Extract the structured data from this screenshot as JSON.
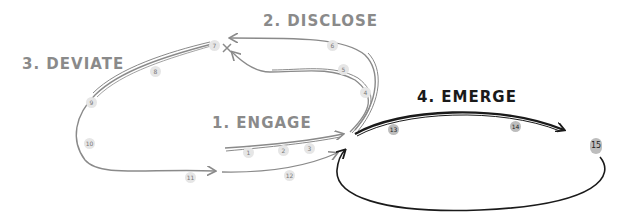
{
  "diagram": {
    "type": "hand-drawn process flow",
    "colors": {
      "gray_stroke": "#8a8a8a",
      "dark_stroke": "#1a1a1a",
      "step_fill": "#e6e6e6"
    },
    "phases": [
      {
        "id": "engage",
        "label": "1. ENGAGE"
      },
      {
        "id": "disclose",
        "label": "2. DISCLOSE"
      },
      {
        "id": "deviate",
        "label": "3. DEVIATE"
      },
      {
        "id": "emerge",
        "label": "4. EMERGE"
      }
    ],
    "steps": [
      "1",
      "2",
      "3",
      "4",
      "5",
      "6",
      "7",
      "8",
      "9",
      "10",
      "11",
      "12",
      "13",
      "14",
      "15"
    ],
    "marker": "x"
  }
}
